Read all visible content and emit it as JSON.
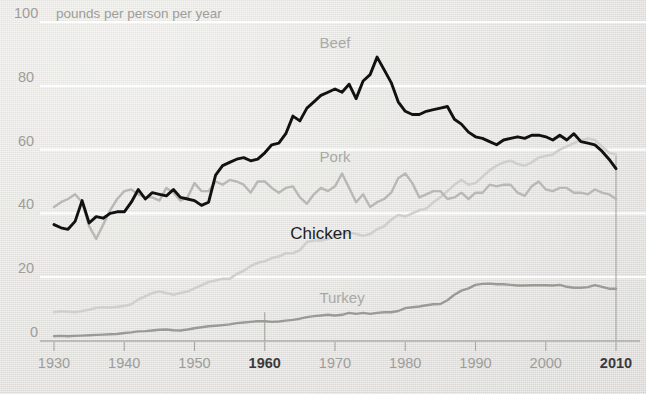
{
  "chart_data": {
    "type": "line",
    "title": "",
    "subtitle": "",
    "unit_label": "pounds per person per year",
    "xlabel": "",
    "ylabel": "",
    "xlim": [
      1930,
      2012
    ],
    "ylim": [
      0,
      100
    ],
    "xticks": [
      "1930",
      "1940",
      "1950",
      "1960",
      "1970",
      "1980",
      "1990",
      "2000",
      "2010"
    ],
    "xticks_emphasis": [
      "1960",
      "2010"
    ],
    "yticks": [
      "0",
      "20",
      "40",
      "60",
      "80",
      "100"
    ],
    "grid": "horizontal-white",
    "legend": "inline-labels",
    "annotations": [
      {
        "name": "vertical-marker-1960",
        "x": 1960,
        "y_from": 9,
        "y_to": 0
      },
      {
        "name": "vertical-marker-2010",
        "x": 2010,
        "y_from": 58,
        "y_to": 0
      }
    ],
    "series": [
      {
        "name": "Beef",
        "color": "#111111",
        "label_x": 1970,
        "label_y": 92,
        "x": [
          1930,
          1931,
          1932,
          1933,
          1934,
          1935,
          1936,
          1937,
          1938,
          1939,
          1940,
          1941,
          1942,
          1943,
          1944,
          1945,
          1946,
          1947,
          1948,
          1949,
          1950,
          1951,
          1952,
          1953,
          1954,
          1955,
          1956,
          1957,
          1958,
          1959,
          1960,
          1961,
          1962,
          1963,
          1964,
          1965,
          1966,
          1967,
          1968,
          1969,
          1970,
          1971,
          1972,
          1973,
          1974,
          1975,
          1976,
          1977,
          1978,
          1979,
          1980,
          1981,
          1982,
          1983,
          1984,
          1985,
          1986,
          1987,
          1988,
          1989,
          1990,
          1991,
          1992,
          1993,
          1994,
          1995,
          1996,
          1997,
          1998,
          1999,
          2000,
          2001,
          2002,
          2003,
          2004,
          2005,
          2006,
          2007,
          2008,
          2009,
          2010
        ],
        "y": [
          36.5,
          35.5,
          35.0,
          37.5,
          44.0,
          37.0,
          39.0,
          38.5,
          40.0,
          40.5,
          40.5,
          43.5,
          47.5,
          44.5,
          46.5,
          46.0,
          45.5,
          47.5,
          45.0,
          44.5,
          44.0,
          42.5,
          43.5,
          52.0,
          55.0,
          56.0,
          57.0,
          57.5,
          56.5,
          57.0,
          59.0,
          61.5,
          62.0,
          65.0,
          70.5,
          69.0,
          73.0,
          75.0,
          77.0,
          78.0,
          79.0,
          78.0,
          80.5,
          76.0,
          81.5,
          83.5,
          89.0,
          85.0,
          81.0,
          75.0,
          72.0,
          71.0,
          71.0,
          72.0,
          72.5,
          73.0,
          73.5,
          69.5,
          68.0,
          65.5,
          64.0,
          63.5,
          62.5,
          61.5,
          63.0,
          63.5,
          64.0,
          63.5,
          64.5,
          64.5,
          64.0,
          63.0,
          64.5,
          63.0,
          65.0,
          62.5,
          62.0,
          61.5,
          59.5,
          57.0,
          54.0
        ]
      },
      {
        "name": "Pork",
        "color": "#b8b8b4",
        "label_x": 1970,
        "label_y": 56,
        "x": [
          1930,
          1931,
          1932,
          1933,
          1934,
          1935,
          1936,
          1937,
          1938,
          1939,
          1940,
          1941,
          1942,
          1943,
          1944,
          1945,
          1946,
          1947,
          1948,
          1949,
          1950,
          1951,
          1952,
          1953,
          1954,
          1955,
          1956,
          1957,
          1958,
          1959,
          1960,
          1961,
          1962,
          1963,
          1964,
          1965,
          1966,
          1967,
          1968,
          1969,
          1970,
          1971,
          1972,
          1973,
          1974,
          1975,
          1976,
          1977,
          1978,
          1979,
          1980,
          1981,
          1982,
          1983,
          1984,
          1985,
          1986,
          1987,
          1988,
          1989,
          1990,
          1991,
          1992,
          1993,
          1994,
          1995,
          1996,
          1997,
          1998,
          1999,
          2000,
          2001,
          2002,
          2003,
          2004,
          2005,
          2006,
          2007,
          2008,
          2009,
          2010
        ],
        "y": [
          42.0,
          43.5,
          44.5,
          46.0,
          43.5,
          36.0,
          32.0,
          36.5,
          41.0,
          44.5,
          47.0,
          47.5,
          46.0,
          45.0,
          45.0,
          44.0,
          48.0,
          46.5,
          44.0,
          45.0,
          49.5,
          47.0,
          47.0,
          50.0,
          49.0,
          50.5,
          50.0,
          49.0,
          46.5,
          50.0,
          50.0,
          48.0,
          46.5,
          48.0,
          48.5,
          45.0,
          43.0,
          46.0,
          48.0,
          47.0,
          48.5,
          52.5,
          48.0,
          43.5,
          46.0,
          42.0,
          43.5,
          44.5,
          46.5,
          51.0,
          52.5,
          49.5,
          45.0,
          46.0,
          47.0,
          47.0,
          44.5,
          45.0,
          46.5,
          44.5,
          46.5,
          46.5,
          49.0,
          48.5,
          49.0,
          49.0,
          46.5,
          45.5,
          48.5,
          50.0,
          47.5,
          47.0,
          48.0,
          48.0,
          46.5,
          46.5,
          46.0,
          47.5,
          46.5,
          46.0,
          44.5
        ]
      },
      {
        "name": "Chicken",
        "color": "#cfcfcb",
        "label_x": 1968,
        "label_y": 32,
        "x": [
          1930,
          1931,
          1932,
          1933,
          1934,
          1935,
          1936,
          1937,
          1938,
          1939,
          1940,
          1941,
          1942,
          1943,
          1944,
          1945,
          1946,
          1947,
          1948,
          1949,
          1950,
          1951,
          1952,
          1953,
          1954,
          1955,
          1956,
          1957,
          1958,
          1959,
          1960,
          1961,
          1962,
          1963,
          1964,
          1965,
          1966,
          1967,
          1968,
          1969,
          1970,
          1971,
          1972,
          1973,
          1974,
          1975,
          1976,
          1977,
          1978,
          1979,
          1980,
          1981,
          1982,
          1983,
          1984,
          1985,
          1986,
          1987,
          1988,
          1989,
          1990,
          1991,
          1992,
          1993,
          1994,
          1995,
          1996,
          1997,
          1998,
          1999,
          2000,
          2001,
          2002,
          2003,
          2004,
          2005,
          2006,
          2007,
          2008,
          2009,
          2010
        ],
        "y": [
          9.0,
          9.3,
          9.2,
          9.0,
          9.4,
          9.8,
          10.4,
          10.6,
          10.5,
          10.7,
          11.0,
          11.5,
          13.0,
          14.0,
          15.0,
          15.5,
          15.0,
          14.5,
          15.0,
          15.5,
          16.5,
          17.5,
          18.5,
          19.0,
          19.5,
          19.5,
          21.0,
          22.0,
          23.5,
          24.5,
          25.0,
          26.0,
          26.5,
          27.5,
          27.5,
          28.5,
          31.0,
          31.5,
          31.5,
          32.0,
          33.0,
          33.5,
          34.0,
          33.5,
          33.0,
          33.5,
          35.0,
          36.0,
          38.0,
          39.5,
          39.0,
          40.0,
          41.0,
          41.5,
          43.5,
          45.0,
          47.0,
          49.0,
          50.5,
          49.0,
          49.5,
          51.5,
          53.5,
          55.0,
          56.0,
          56.5,
          55.5,
          55.0,
          56.0,
          57.5,
          58.0,
          58.5,
          60.0,
          61.0,
          62.0,
          63.0,
          63.5,
          63.0,
          61.0,
          59.0,
          58.5
        ]
      },
      {
        "name": "Turkey",
        "color": "#9a9a96",
        "label_x": 1971,
        "label_y": 12,
        "x": [
          1930,
          1931,
          1932,
          1933,
          1934,
          1935,
          1936,
          1937,
          1938,
          1939,
          1940,
          1941,
          1942,
          1943,
          1944,
          1945,
          1946,
          1947,
          1948,
          1949,
          1950,
          1951,
          1952,
          1953,
          1954,
          1955,
          1956,
          1957,
          1958,
          1959,
          1960,
          1961,
          1962,
          1963,
          1964,
          1965,
          1966,
          1967,
          1968,
          1969,
          1970,
          1971,
          1972,
          1973,
          1974,
          1975,
          1976,
          1977,
          1978,
          1979,
          1980,
          1981,
          1982,
          1983,
          1984,
          1985,
          1986,
          1987,
          1988,
          1989,
          1990,
          1991,
          1992,
          1993,
          1994,
          1995,
          1996,
          1997,
          1998,
          1999,
          2000,
          2001,
          2002,
          2003,
          2004,
          2005,
          2006,
          2007,
          2008,
          2009,
          2010
        ],
        "y": [
          1.5,
          1.6,
          1.5,
          1.6,
          1.7,
          1.8,
          1.9,
          2.0,
          2.1,
          2.2,
          2.5,
          2.7,
          3.0,
          3.1,
          3.3,
          3.5,
          3.6,
          3.4,
          3.3,
          3.6,
          4.0,
          4.3,
          4.6,
          4.8,
          5.0,
          5.2,
          5.6,
          5.8,
          6.0,
          6.2,
          6.2,
          6.0,
          6.1,
          6.4,
          6.6,
          7.0,
          7.5,
          7.8,
          8.0,
          8.2,
          8.0,
          8.2,
          8.8,
          8.5,
          8.8,
          8.5,
          8.8,
          9.0,
          9.0,
          9.4,
          10.3,
          10.6,
          10.8,
          11.2,
          11.5,
          11.6,
          12.8,
          14.5,
          15.8,
          16.5,
          17.6,
          17.9,
          18.0,
          17.8,
          17.8,
          17.6,
          17.4,
          17.4,
          17.5,
          17.5,
          17.5,
          17.4,
          17.6,
          17.0,
          16.7,
          16.7,
          16.9,
          17.5,
          17.0,
          16.4,
          16.4
        ]
      }
    ]
  },
  "axes": {
    "unit_label": "pounds per person per year",
    "y_tick_labels": [
      "100",
      "80",
      "60",
      "40",
      "20",
      "0"
    ],
    "x_tick_labels": [
      "1930",
      "1940",
      "1950",
      "1960",
      "1970",
      "1980",
      "1990",
      "2000",
      "2010"
    ]
  },
  "series_labels": [
    {
      "text": "Beef",
      "style": "muted"
    },
    {
      "text": "Pork",
      "style": "muted"
    },
    {
      "text": "Chicken",
      "style": "dark"
    },
    {
      "text": "Turkey",
      "style": "muted"
    }
  ],
  "colors": {
    "beef": "#111111",
    "pork": "#b8b8b4",
    "chicken": "#cfcfcb",
    "turkey": "#9a9a96",
    "background": "#e8e8e6",
    "gridline": "#ffffff",
    "tick_text": "#9d9d9a",
    "tick_text_emphasis": "#3b3b3b"
  }
}
